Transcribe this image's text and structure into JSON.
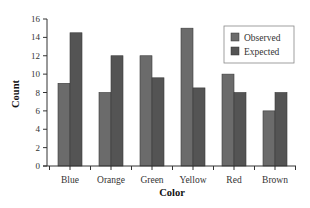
{
  "chart_data": {
    "type": "bar",
    "title": "",
    "xlabel": "Color",
    "ylabel": "Count",
    "categories": [
      "Blue",
      "Orange",
      "Green",
      "Yellow",
      "Red",
      "Brown"
    ],
    "series": [
      {
        "name": "Observed",
        "values": [
          9,
          8,
          12,
          15,
          10,
          6
        ],
        "color": "#6b6b6b"
      },
      {
        "name": "Expected",
        "values": [
          14.5,
          12,
          9.6,
          8.5,
          8,
          8
        ],
        "color": "#545454"
      }
    ],
    "ylim": [
      0,
      16
    ],
    "yticks": [
      0,
      2,
      4,
      6,
      8,
      10,
      12,
      14,
      16
    ],
    "grid": false,
    "legend_position": "upper right"
  },
  "legend": {
    "observed_label": "Observed",
    "expected_label": "Expected"
  },
  "axes": {
    "xlabel": "Color",
    "ylabel": "Count"
  }
}
